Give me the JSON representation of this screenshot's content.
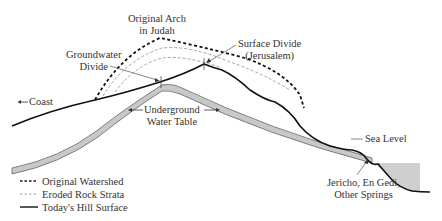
{
  "labels": {
    "original_arch": [
      "Original Arch",
      "in Judah"
    ],
    "groundwater_divide": [
      "Groundwater",
      "Divide"
    ],
    "surface_divide": [
      "Surface Divide",
      "(Jerusalem)"
    ],
    "coast": "Coast",
    "underground_water_table": [
      "Underground",
      "Water Table"
    ],
    "sea_level": "Sea Level",
    "springs": [
      "Jericho, En Gedi,",
      "Other Springs"
    ]
  },
  "legend": [
    {
      "style": "thick-dashed",
      "label": "Original Watershed"
    },
    {
      "style": "thin-dashed",
      "label": "Eroded Rock Strata"
    },
    {
      "style": "solid",
      "label": "Today's Hill Surface"
    }
  ],
  "colors": {
    "line": "#111111",
    "strata": "#999999",
    "water_table_fill": "#c8c8c8",
    "sea_fill": "#cfcfcf",
    "text": "#333333"
  }
}
